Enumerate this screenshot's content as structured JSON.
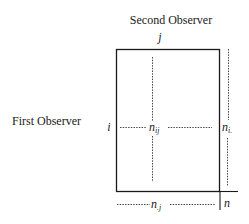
{
  "diagram": {
    "title_top": "Second Observer",
    "title_left": "First Observer",
    "column_index": "j",
    "row_index": "i",
    "cell_label": "n",
    "cell_subscript": "ij",
    "row_total_label": "n",
    "row_total_subscript": "i.",
    "column_total_label": "n",
    "column_total_subscript": ".j",
    "grand_total_label": "n"
  },
  "colors": {
    "ink": "#1a1a1a",
    "background": "#ffffff"
  }
}
